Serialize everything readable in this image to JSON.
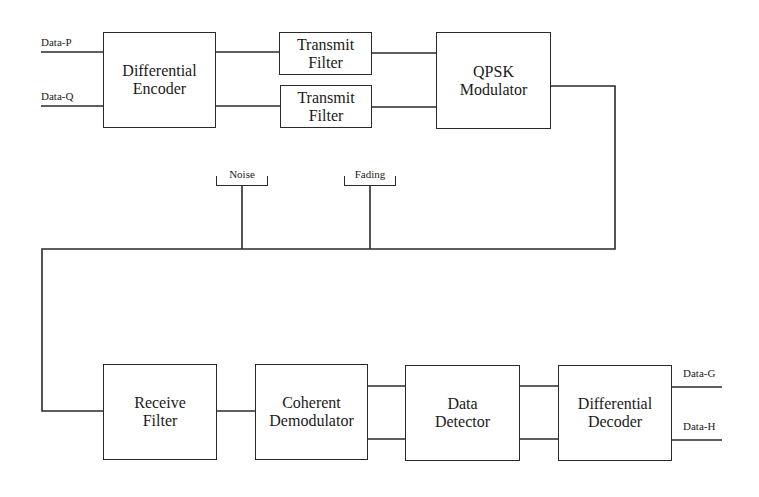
{
  "diagram": {
    "type": "block-diagram",
    "title": "",
    "inputs": {
      "data_p": "Data-P",
      "data_q": "Data-Q"
    },
    "outputs": {
      "data_g": "Data-G",
      "data_h": "Data-H"
    },
    "blocks": {
      "diff_encoder": {
        "line1": "Differential",
        "line2": "Encoder"
      },
      "tx_filter_1": {
        "line1": "Transmit",
        "line2": "Filter"
      },
      "tx_filter_2": {
        "line1": "Transmit",
        "line2": "Filter"
      },
      "qpsk_mod": {
        "line1": "QPSK",
        "line2": "Modulator"
      },
      "receive_filter": {
        "line1": "Receive",
        "line2": "Filter"
      },
      "coherent_demod": {
        "line1": "Coherent",
        "line2": "Demodulator"
      },
      "data_detector": {
        "line1": "Data",
        "line2": "Detector"
      },
      "diff_decoder": {
        "line1": "Differential",
        "line2": "Decoder"
      }
    },
    "channel_impairments": {
      "noise": "Noise",
      "fading": "Fading"
    },
    "connections": [
      [
        "Data-P",
        "Differential Encoder"
      ],
      [
        "Data-Q",
        "Differential Encoder"
      ],
      [
        "Differential Encoder",
        "Transmit Filter (upper)"
      ],
      [
        "Differential Encoder",
        "Transmit Filter (lower)"
      ],
      [
        "Transmit Filter (upper)",
        "QPSK Modulator"
      ],
      [
        "Transmit Filter (lower)",
        "QPSK Modulator"
      ],
      [
        "QPSK Modulator",
        "Channel"
      ],
      [
        "Noise",
        "Channel"
      ],
      [
        "Fading",
        "Channel"
      ],
      [
        "Channel",
        "Receive Filter"
      ],
      [
        "Receive Filter",
        "Coherent Demodulator"
      ],
      [
        "Coherent Demodulator",
        "Data Detector"
      ],
      [
        "Coherent Demodulator",
        "Data Detector"
      ],
      [
        "Data Detector",
        "Differential Decoder"
      ],
      [
        "Data Detector",
        "Differential Decoder"
      ],
      [
        "Differential Decoder",
        "Data-G"
      ],
      [
        "Differential Decoder",
        "Data-H"
      ]
    ],
    "colors": {
      "line": "#2a2a2a",
      "background": "#ffffff"
    }
  }
}
